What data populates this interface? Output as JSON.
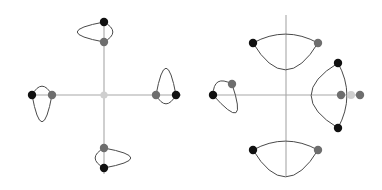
{
  "figure": {
    "title": "",
    "canvas": {
      "width": 382,
      "height": 190,
      "background": "#ffffff"
    },
    "colors": {
      "axis": "#a8a8a8",
      "curve": "#4a4a4a",
      "dot_black": "#111111",
      "dot_gray": "#6e6e6e",
      "dot_light": "#cfcfcf",
      "background": "#ffffff"
    },
    "panels": [
      {
        "name": "left-panel",
        "label": "symmetric-configuration",
        "center": {
          "x": 104,
          "y": 95
        },
        "axes": {
          "horizontal": {
            "x1": 28,
            "y1": 95,
            "x2": 181,
            "y2": 95
          },
          "vertical": {
            "x1": 104,
            "y1": 18,
            "x2": 104,
            "y2": 174
          }
        },
        "center_dot": {
          "x": 104,
          "y": 95,
          "color": "dot_light",
          "r": 3.6
        },
        "lenses": [
          {
            "name": "north-lens",
            "orientation": "up",
            "tip_outer": {
              "x": 104,
              "y": 22,
              "color": "dot_black",
              "r": 4.2
            },
            "tip_inner": {
              "x": 104,
              "y": 42,
              "color": "dot_gray",
              "r": 4.2
            },
            "arc_outer_bulge": 27,
            "arc_inner_bulge": 9
          },
          {
            "name": "east-lens",
            "orientation": "right",
            "tip_outer": {
              "x": 176,
              "y": 95,
              "color": "dot_black",
              "r": 4.2
            },
            "tip_inner": {
              "x": 156,
              "y": 95,
              "color": "dot_gray",
              "r": 4.2
            },
            "arc_outer_bulge": 27,
            "arc_inner_bulge": 9
          },
          {
            "name": "south-lens",
            "orientation": "down",
            "tip_outer": {
              "x": 104,
              "y": 168,
              "color": "dot_black",
              "r": 4.2
            },
            "tip_inner": {
              "x": 104,
              "y": 148,
              "color": "dot_gray",
              "r": 4.2
            },
            "arc_outer_bulge": 27,
            "arc_inner_bulge": 9
          },
          {
            "name": "west-lens",
            "orientation": "left",
            "tip_outer": {
              "x": 32,
              "y": 95,
              "color": "dot_black",
              "r": 4.2
            },
            "tip_inner": {
              "x": 52,
              "y": 95,
              "color": "dot_gray",
              "r": 4.2
            },
            "arc_outer_bulge": 27,
            "arc_inner_bulge": 9
          }
        ]
      },
      {
        "name": "right-panel",
        "label": "rotated-configuration",
        "center": {
          "x": 286,
          "y": 95
        },
        "axes": {
          "horizontal": {
            "x1": 209,
            "y1": 95,
            "x2": 364,
            "y2": 95
          },
          "vertical": {
            "x1": 286,
            "y1": 15,
            "x2": 286,
            "y2": 176
          }
        },
        "center_dot": null,
        "lenses": [
          {
            "name": "north-lens",
            "orientation": "up-rotated",
            "tip_outer": {
              "x": 253,
              "y": 43,
              "color": "dot_black",
              "r": 4.2
            },
            "tip_inner": {
              "x": 318,
              "y": 43,
              "color": "dot_gray",
              "r": 4.2
            },
            "arc_outer_bulge": 27,
            "arc_inner_bulge": 9
          },
          {
            "name": "east-lens",
            "orientation": "right-rotated",
            "tip_outer": {
              "x": 338,
              "y": 63,
              "color": "dot_black",
              "r": 4.2
            },
            "tip_inner": {
              "x": 338,
              "y": 128,
              "color": "dot_black",
              "r": 4.2
            },
            "arc_outer_bulge": 27,
            "arc_inner_bulge": 9
          },
          {
            "name": "south-lens",
            "orientation": "down-rotated",
            "tip_outer": {
              "x": 253,
              "y": 150,
              "color": "dot_black",
              "r": 4.2
            },
            "tip_inner": {
              "x": 318,
              "y": 150,
              "color": "dot_gray",
              "r": 4.2
            },
            "arc_outer_bulge": 27,
            "arc_inner_bulge": 9
          },
          {
            "name": "west-lens",
            "orientation": "left-rotated",
            "tip_outer": {
              "x": 213,
              "y": 95,
              "color": "dot_black",
              "r": 4.2
            },
            "tip_inner": {
              "x": 232,
              "y": 84,
              "color": "dot_gray",
              "r": 4.2
            },
            "arc_outer_bulge": 27,
            "arc_inner_bulge": 9
          }
        ],
        "axis_dot_cluster": [
          {
            "name": "cluster-dot-left",
            "x": 341,
            "y": 95,
            "color": "dot_gray",
            "r": 4.2
          },
          {
            "name": "cluster-dot-middle",
            "x": 351,
            "y": 95,
            "color": "dot_light",
            "r": 4.0
          },
          {
            "name": "cluster-dot-right",
            "x": 360,
            "y": 95,
            "color": "dot_gray",
            "r": 4.2
          }
        ]
      }
    ]
  },
  "chart_data": {
    "type": "scatter",
    "title": "",
    "subtitle": "",
    "xlabel": "",
    "ylabel": "",
    "grid": false,
    "legend": null,
    "panels": [
      {
        "name": "left-panel",
        "points": [
          {
            "label": "origin",
            "x": 0.0,
            "y": 0.0,
            "color": "#cfcfcf"
          },
          {
            "label": "north-outer",
            "x": 0.0,
            "y": 0.96,
            "color": "#111111"
          },
          {
            "label": "north-inner",
            "x": 0.0,
            "y": 0.7,
            "color": "#6e6e6e"
          },
          {
            "label": "east-outer",
            "x": 0.96,
            "y": 0.0,
            "color": "#111111"
          },
          {
            "label": "east-inner",
            "x": 0.7,
            "y": 0.0,
            "color": "#6e6e6e"
          },
          {
            "label": "south-outer",
            "x": 0.0,
            "y": -0.96,
            "color": "#111111"
          },
          {
            "label": "south-inner",
            "x": 0.0,
            "y": -0.7,
            "color": "#6e6e6e"
          },
          {
            "label": "west-outer",
            "x": -0.96,
            "y": 0.0,
            "color": "#111111"
          },
          {
            "label": "west-inner",
            "x": -0.7,
            "y": 0.0,
            "color": "#6e6e6e"
          }
        ]
      },
      {
        "name": "right-panel",
        "points": [
          {
            "label": "north-lens-left-tip",
            "x": -0.44,
            "y": 0.69,
            "color": "#111111"
          },
          {
            "label": "north-lens-right-tip",
            "x": 0.43,
            "y": 0.69,
            "color": "#6e6e6e"
          },
          {
            "label": "east-lens-top-tip",
            "x": 0.69,
            "y": 0.43,
            "color": "#111111"
          },
          {
            "label": "east-lens-bottom-tip",
            "x": 0.69,
            "y": -0.44,
            "color": "#111111"
          },
          {
            "label": "south-lens-left-tip",
            "x": -0.44,
            "y": -0.73,
            "color": "#111111"
          },
          {
            "label": "south-lens-right-tip",
            "x": 0.43,
            "y": -0.73,
            "color": "#6e6e6e"
          },
          {
            "label": "west-lens-outer-tip",
            "x": -0.97,
            "y": 0.0,
            "color": "#111111"
          },
          {
            "label": "west-lens-inner-tip",
            "x": -0.72,
            "y": 0.15,
            "color": "#6e6e6e"
          },
          {
            "label": "axis-cluster-left",
            "x": 0.73,
            "y": 0.0,
            "color": "#6e6e6e"
          },
          {
            "label": "axis-cluster-middle",
            "x": 0.86,
            "y": 0.0,
            "color": "#cfcfcf"
          },
          {
            "label": "axis-cluster-right",
            "x": 0.98,
            "y": 0.0,
            "color": "#6e6e6e"
          }
        ]
      }
    ]
  }
}
